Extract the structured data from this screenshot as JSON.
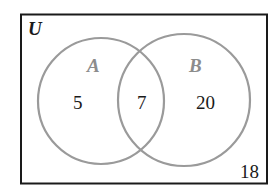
{
  "diagram": {
    "type": "venn",
    "universe_label": "U",
    "sets": [
      {
        "name": "A",
        "only_count": "5"
      },
      {
        "name": "B",
        "only_count": "20"
      }
    ],
    "intersection_count": "7",
    "outside_count": "18",
    "colors": {
      "border": "#1a1a1a",
      "circle": "#9a9a9a",
      "set_label": "#8c8c8c",
      "text": "#1a1a1a"
    }
  }
}
